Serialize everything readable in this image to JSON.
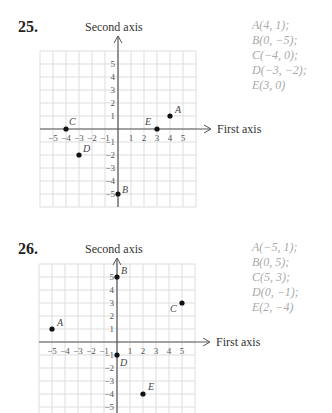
{
  "problems": [
    {
      "number": "25.",
      "y_axis_title": "Second axis",
      "x_axis_title": "First axis",
      "answers": [
        "A(4, 1);",
        "B(0, −5);",
        "C(−4, 0);",
        "D(−3, −2);",
        "E(3, 0)"
      ]
    },
    {
      "number": "26.",
      "y_axis_title": "Second axis",
      "x_axis_title": "First axis",
      "answers": [
        "A(−5, 1);",
        "B(0, 5);",
        "C(5, 3);",
        "D(0, −1);",
        "E(2, −4)"
      ]
    }
  ],
  "colors": {
    "grid": "#dddddd",
    "axis": "#555555",
    "point": "#111111",
    "answer_text": "#aaaaaa"
  },
  "chart_data": [
    {
      "type": "scatter",
      "title": "25.",
      "xlabel": "First axis",
      "ylabel": "Second axis",
      "xlim": [
        -6,
        6
      ],
      "ylim": [
        -6,
        6
      ],
      "grid": true,
      "x_ticks": [
        -5,
        -4,
        -3,
        -2,
        -1,
        1,
        2,
        3,
        4,
        5
      ],
      "y_ticks": [
        -5,
        -4,
        -3,
        -2,
        -1,
        1,
        2,
        3,
        4,
        5
      ],
      "points": [
        {
          "label": "A",
          "x": 4,
          "y": 1
        },
        {
          "label": "B",
          "x": 0,
          "y": -5
        },
        {
          "label": "C",
          "x": -4,
          "y": 0
        },
        {
          "label": "D",
          "x": -3,
          "y": -2
        },
        {
          "label": "E",
          "x": 3,
          "y": 0
        }
      ]
    },
    {
      "type": "scatter",
      "title": "26.",
      "xlabel": "First axis",
      "ylabel": "Second axis",
      "xlim": [
        -6,
        6
      ],
      "ylim": [
        -6,
        6
      ],
      "grid": true,
      "x_ticks": [
        -5,
        -4,
        -3,
        -2,
        -1,
        1,
        2,
        3,
        4,
        5
      ],
      "y_ticks": [
        -5,
        -4,
        -3,
        -2,
        -1,
        1,
        2,
        3,
        4,
        5
      ],
      "points": [
        {
          "label": "A",
          "x": -5,
          "y": 1
        },
        {
          "label": "B",
          "x": 0,
          "y": 5
        },
        {
          "label": "C",
          "x": 5,
          "y": 3
        },
        {
          "label": "D",
          "x": 0,
          "y": -1
        },
        {
          "label": "E",
          "x": 2,
          "y": -4
        }
      ]
    }
  ]
}
